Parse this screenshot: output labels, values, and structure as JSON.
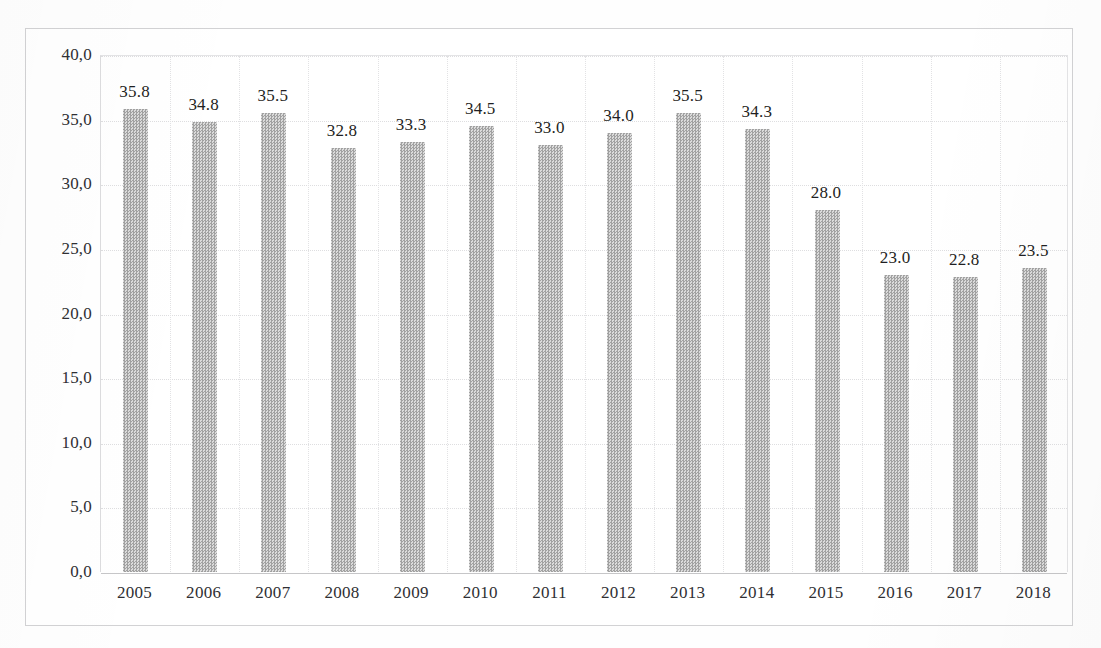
{
  "chart_data": {
    "type": "bar",
    "title": "",
    "subtitle": "",
    "xlabel": "",
    "ylabel": "",
    "categories": [
      "2005",
      "2006",
      "2007",
      "2008",
      "2009",
      "2010",
      "2011",
      "2012",
      "2013",
      "2014",
      "2015",
      "2016",
      "2017",
      "2018"
    ],
    "values": [
      35.8,
      34.8,
      35.5,
      32.8,
      33.3,
      34.5,
      33.0,
      34.0,
      35.5,
      34.3,
      28.0,
      23.0,
      22.8,
      23.5
    ],
    "value_labels": [
      "35.8",
      "34.8",
      "35.5",
      "32.8",
      "33.3",
      "34.5",
      "33.0",
      "34.0",
      "35.5",
      "34.3",
      "28.0",
      "23.0",
      "22.8",
      "23.5"
    ],
    "ylim": [
      0,
      40
    ],
    "ytick_step": 5,
    "ytick_labels": [
      "40,0",
      "35,0",
      "30,0",
      "25,0",
      "20,0",
      "15,0",
      "10,0",
      "5,0",
      "0,0"
    ],
    "ytick_values": [
      40,
      35,
      30,
      25,
      20,
      15,
      10,
      5,
      0
    ],
    "grid": "both",
    "legend": "none",
    "bar_color": "#b4b4b4",
    "bar_texture": "dithered-halftone-checker",
    "axis_color": "#c6c6c8",
    "gridline_color": "#dedee0",
    "text_color": "#2f2f33",
    "decimal_separator_axis": ",",
    "decimal_separator_labels": "."
  },
  "scan": {
    "top_text_remnant": "",
    "frame_border_color": "#d2d2d4",
    "background_color": "#fefefe"
  }
}
